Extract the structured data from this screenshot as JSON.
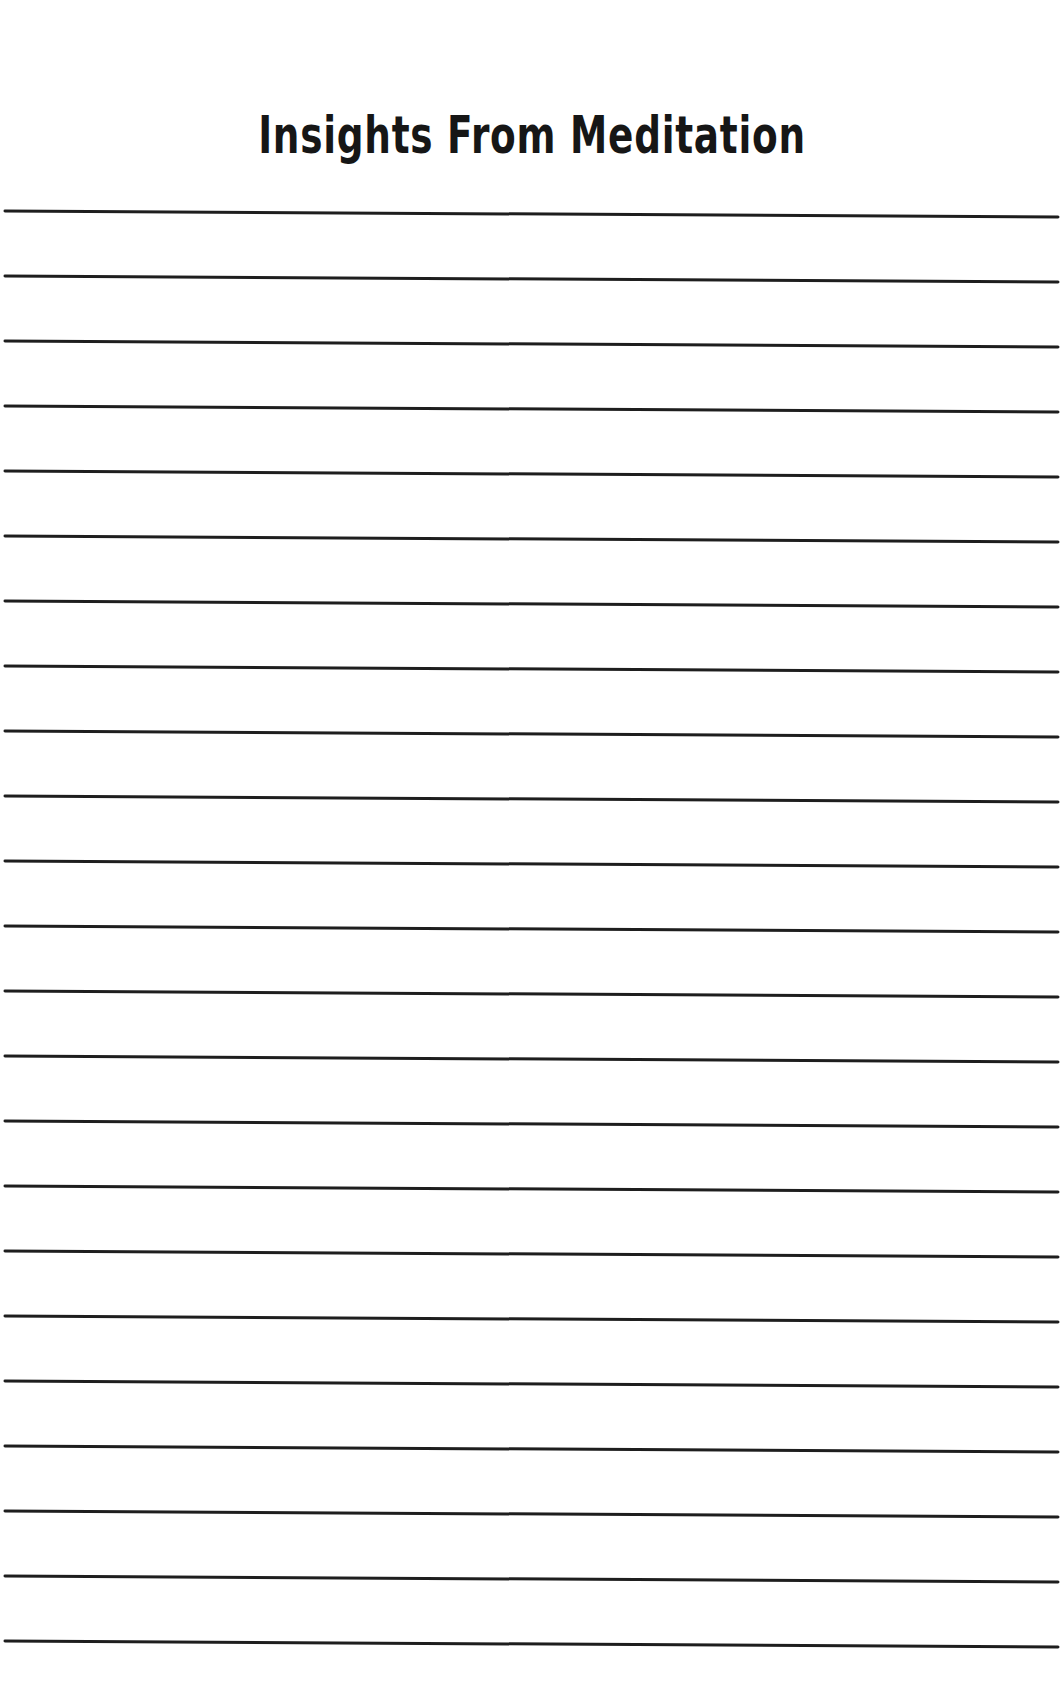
{
  "page": {
    "title": "Insights From Meditation",
    "background_color": "#ffffff",
    "ink_color": "#1e1e1e"
  },
  "ruled_lines": {
    "count": 23,
    "first_y_left": 211,
    "spacing": 65,
    "x_start": 5,
    "x_end": 1058,
    "slope_drop": 6,
    "thickness": 3
  }
}
